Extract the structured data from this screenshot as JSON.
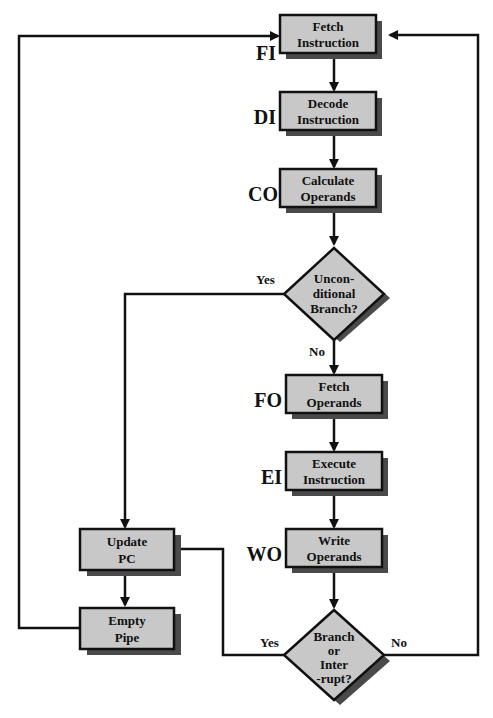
{
  "diagram": {
    "type": "instruction-pipeline-flowchart",
    "colors": {
      "box_fill": "#c8c8c8",
      "shadow": "#4a4a4a",
      "line": "#111111",
      "background": "#ffffff"
    },
    "boxes": [
      {
        "id": "fi",
        "stage": "FI",
        "line1": "Fetch",
        "line2": "Instruction"
      },
      {
        "id": "di",
        "stage": "DI",
        "line1": "Decode",
        "line2": "Instruction"
      },
      {
        "id": "co",
        "stage": "CO",
        "line1": "Calculate",
        "line2": "Operands"
      },
      {
        "id": "fo",
        "stage": "FO",
        "line1": "Fetch",
        "line2": "Operands"
      },
      {
        "id": "ei",
        "stage": "EI",
        "line1": "Execute",
        "line2": "Instruction"
      },
      {
        "id": "wo",
        "stage": "WO",
        "line1": "Write",
        "line2": "Operands"
      },
      {
        "id": "upc",
        "line1": "Update",
        "line2": "PC"
      },
      {
        "id": "ep",
        "line1": "Empty",
        "line2": "Pipe"
      }
    ],
    "decisions": [
      {
        "id": "uncond",
        "lines": [
          "Uncon-",
          "ditional",
          "Branch?"
        ],
        "yes": "Yes",
        "no": "No"
      },
      {
        "id": "brint",
        "lines": [
          "Branch",
          "or",
          "Inter",
          "-rupt?"
        ],
        "yes": "Yes",
        "no": "No"
      }
    ]
  }
}
